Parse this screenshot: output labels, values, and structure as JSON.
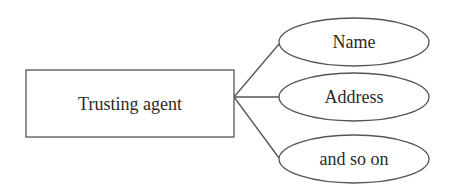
{
  "diagram": {
    "type": "entity-attribute",
    "colors": {
      "stroke": "#555555",
      "text": "#2a2a2a",
      "background": "#ffffff"
    },
    "entity": {
      "label": "Trusting agent"
    },
    "attributes": [
      {
        "label": "Name"
      },
      {
        "label": "Address"
      },
      {
        "label": "and so on"
      }
    ]
  }
}
